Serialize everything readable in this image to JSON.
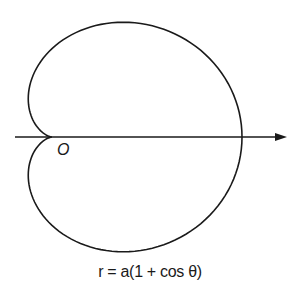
{
  "diagram": {
    "equation": "r = a(1 + cos θ)",
    "origin_label": "O",
    "curve": {
      "type": "cardioid",
      "a_px": 95,
      "pole": [
        52,
        137
      ],
      "y_scale": 0.93,
      "stroke": "#1a1a1a",
      "stroke_width": 1.6
    },
    "axis": {
      "x_start": 15,
      "x_end": 287,
      "y": 137,
      "direction": "right",
      "color": "#1a1a1a"
    }
  }
}
